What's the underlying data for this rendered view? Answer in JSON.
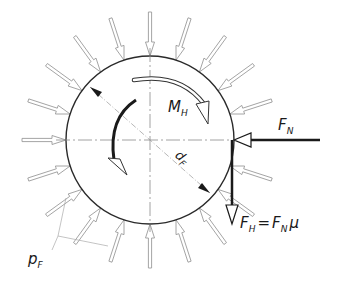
{
  "diagram": {
    "type": "friction-clamp-force-diagram",
    "center": [
      150,
      140
    ],
    "radius": 84,
    "pressure_arrow_count": 20,
    "labels": {
      "moment": {
        "main": "M",
        "sub": "H"
      },
      "diameter": {
        "main": "d",
        "sub": "F"
      },
      "normal_force": {
        "main": "F",
        "sub": "N"
      },
      "friction_force": {
        "main": "F",
        "sub": "H",
        "equation_rhs_main": "F",
        "equation_rhs_sub": "N",
        "equation_rhs_factor": "μ",
        "equals": "="
      },
      "pressure": {
        "main": "p",
        "sub": "F"
      }
    },
    "colors": {
      "outline": "#2a2a2a",
      "light": "#9a9a9a",
      "centerline": "#8a8a8a",
      "bold": "#1a1a1a"
    }
  }
}
